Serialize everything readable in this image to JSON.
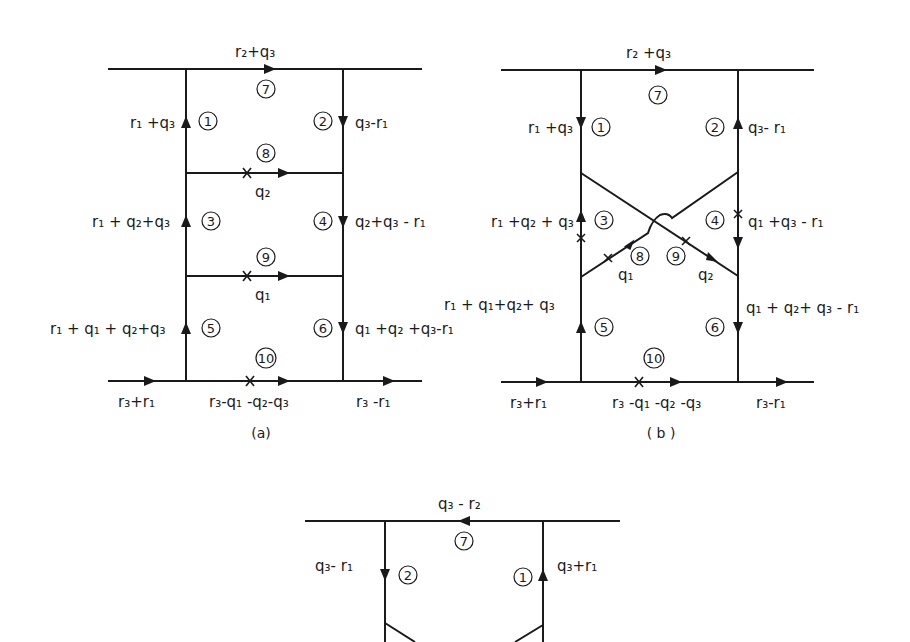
{
  "diagrams": {
    "a": {
      "caption": "(a)",
      "top_label": "r₂+q₃",
      "edges": {
        "e1": "r₁ +q₃",
        "e2": "q₃-r₁",
        "e3": "r₁ + q₂+q₃",
        "e4": "q₂+q₃ - r₁",
        "e5": "r₁ + q₁ + q₂+q₃",
        "e6": "q₁ +q₂ +q₃-r₁",
        "e8": "q₂",
        "e9": "q₁",
        "e10": "r₃-q₁ -q₂-q₃",
        "in": "r₃+r₁",
        "out": "r₃ -r₁"
      },
      "vertex_numbers": [
        "1",
        "2",
        "3",
        "4",
        "5",
        "6",
        "7",
        "8",
        "9",
        "10"
      ]
    },
    "b": {
      "caption": "( b )",
      "top_label": "r₂ +q₃",
      "edges": {
        "e1": "r₁ +q₃",
        "e2": "q₃- r₁",
        "e3": "r₁ +q₂ + q₃",
        "e4": "q₁ +q₃ - r₁",
        "e5": "r₁ + q₁+q₂+ q₃",
        "e6": "q₁ + q₂+ q₃ - r₁",
        "e8": "q₁",
        "e9": "q₂",
        "e10": "r₃ -q₁ -q₂ -q₃",
        "in": "r₃+r₁",
        "out": "r₃-r₁"
      },
      "vertex_numbers": [
        "1",
        "2",
        "3",
        "4",
        "5",
        "6",
        "7",
        "8",
        "9",
        "10"
      ]
    },
    "c": {
      "top_label": "q₃ - r₂",
      "edges": {
        "e2": "q₃- r₁",
        "e1": "q₃+r₁"
      },
      "vertex_numbers": [
        "7",
        "2",
        "1"
      ]
    }
  }
}
